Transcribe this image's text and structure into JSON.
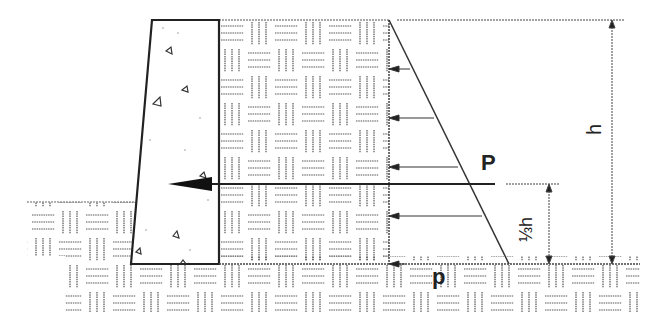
{
  "diagram": {
    "labels": {
      "resultant_force": "P",
      "pressure_at_base": "p",
      "height": "h",
      "resultant_height": "⅓h"
    },
    "colors": {
      "line": "#333333",
      "hatch": "#555555",
      "background": "#ffffff"
    },
    "elements": {
      "wall": "concrete retaining wall (trapezoid, sloped front face)",
      "backfill": "soil backfill with basketweave hatch",
      "ground": "foundation soil with basketweave hatch",
      "pressure_diagram": "triangular lateral earth pressure increasing with depth",
      "pressure_arrows": 5,
      "resultant_arrow": "horizontal arrow acting at one third of height"
    }
  }
}
